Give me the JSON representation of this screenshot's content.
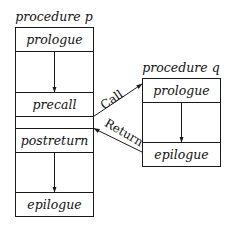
{
  "procedure_p": {
    "title": "procedure p",
    "sections": [
      "prologue",
      "precall",
      "postreturn",
      "epilogue"
    ]
  },
  "procedure_q": {
    "title": "procedure q",
    "sections": [
      "prologue",
      "epilogue"
    ]
  },
  "edges": {
    "call_label": "Call",
    "return_label": "Return"
  }
}
